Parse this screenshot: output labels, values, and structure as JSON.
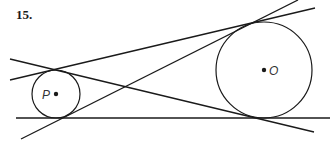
{
  "problem": {
    "number": "15."
  },
  "colors": {
    "stroke": "#1a1a1a",
    "label": "#333333",
    "background": "#ffffff"
  },
  "circles": [
    {
      "name": "P",
      "label": "P",
      "cx": 56,
      "cy": 94,
      "r": 24,
      "label_x": 42,
      "label_y": 99
    },
    {
      "name": "O",
      "label": "O",
      "cx": 264,
      "cy": 70,
      "r": 48,
      "label_x": 269,
      "label_y": 75
    }
  ],
  "tangent_lines": [
    {
      "name": "bottom-external-tangent",
      "x1": 16,
      "y1": 118,
      "x2": 330,
      "y2": 118
    },
    {
      "name": "top-external-tangent",
      "x1": 10,
      "y1": 80,
      "x2": 315,
      "y2": 8
    },
    {
      "name": "internal-tangent-1",
      "x1": 10,
      "y1": 59,
      "x2": 314,
      "y2": 132
    },
    {
      "name": "internal-tangent-2",
      "x1": 21,
      "y1": 139,
      "x2": 298,
      "y2": 0
    }
  ]
}
